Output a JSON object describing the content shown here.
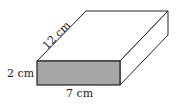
{
  "diagram": {
    "type": "rectangular-prism",
    "labels": {
      "length": "12 cm",
      "height": "2 cm",
      "width": "7 cm"
    },
    "colors": {
      "front_face": "#a6a6a6",
      "edges": "#222222",
      "top_face": "#ffffff",
      "side_face": "#ffffff"
    }
  }
}
